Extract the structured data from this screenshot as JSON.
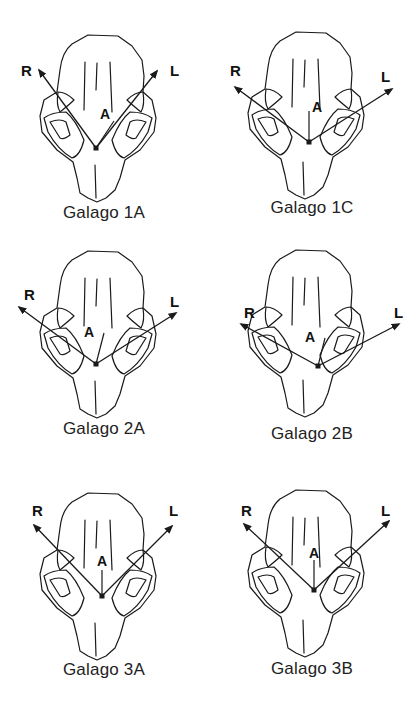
{
  "figure": {
    "panels": [
      {
        "id": "1A",
        "caption": "Galago 1A",
        "left": 0,
        "top": 0,
        "skull_dy": 0,
        "R_label": "R",
        "L_label": "L",
        "A_label": "A",
        "vertex": [
          96,
          148
        ],
        "R_tip": [
          39,
          70
        ],
        "L_tip": [
          157,
          71
        ],
        "A_tip": [
          114,
          121
        ],
        "R_pos": [
          21,
          62
        ],
        "L_pos": [
          170,
          62
        ],
        "A_pos": [
          100,
          106
        ],
        "caption_top": 203
      },
      {
        "id": "1C",
        "caption": "Galago 1C",
        "left": 208,
        "top": 0,
        "skull_dy": -3,
        "R_label": "R",
        "L_label": "L",
        "A_label": "A",
        "vertex": [
          101,
          142
        ],
        "R_tip": [
          27,
          87
        ],
        "L_tip": [
          184,
          89
        ],
        "A_tip": [
          101,
          111
        ],
        "R_pos": [
          22,
          62
        ],
        "L_pos": [
          173,
          68
        ],
        "A_pos": [
          104,
          99
        ],
        "caption_top": 198
      },
      {
        "id": "2A",
        "caption": "Galago 2A",
        "left": 0,
        "top": 230,
        "skull_dy": -14,
        "R_label": "R",
        "L_label": "L",
        "A_label": "A",
        "vertex": [
          96,
          134
        ],
        "R_tip": [
          19,
          77
        ],
        "L_tip": [
          176,
          83
        ],
        "A_tip": [
          104,
          103
        ],
        "R_pos": [
          24,
          56
        ],
        "L_pos": [
          170,
          63
        ],
        "A_pos": [
          84,
          94
        ],
        "caption_top": 189
      },
      {
        "id": "2B",
        "caption": "Galago 2B",
        "left": 208,
        "top": 230,
        "skull_dy": -15,
        "R_label": "R",
        "L_label": "L",
        "A_label": "A",
        "vertex": [
          110,
          136
        ],
        "R_tip": [
          33,
          94
        ],
        "L_tip": [
          191,
          94
        ],
        "A_tip": [
          117,
          108
        ],
        "R_pos": [
          36,
          74
        ],
        "L_pos": [
          186,
          74
        ],
        "A_pos": [
          97,
          99
        ],
        "caption_top": 194
      },
      {
        "id": "3A",
        "caption": "Galago 3A",
        "left": 0,
        "top": 460,
        "skull_dy": -2,
        "R_label": "R",
        "L_label": "L",
        "A_label": "A",
        "vertex": [
          102,
          136
        ],
        "R_tip": [
          34,
          65
        ],
        "L_tip": [
          172,
          66
        ],
        "A_tip": [
          102,
          110
        ],
        "R_pos": [
          32,
          42
        ],
        "L_pos": [
          169,
          42
        ],
        "A_pos": [
          97,
          93
        ],
        "caption_top": 200
      },
      {
        "id": "3B",
        "caption": "Galago 3B",
        "left": 208,
        "top": 460,
        "skull_dy": -5,
        "R_label": "R",
        "L_label": "L",
        "A_label": "A",
        "vertex": [
          106,
          130
        ],
        "R_tip": [
          36,
          64
        ],
        "L_tip": [
          181,
          61
        ],
        "A_tip": [
          106,
          100
        ],
        "R_pos": [
          33,
          42
        ],
        "L_pos": [
          173,
          42
        ],
        "A_pos": [
          101,
          85
        ],
        "caption_top": 199
      }
    ]
  },
  "colors": {
    "ink": "#1a1a1a",
    "background": "#ffffff"
  }
}
